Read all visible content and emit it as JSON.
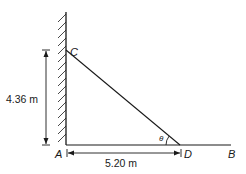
{
  "diagram": {
    "points": {
      "C": "C",
      "A": "A",
      "D": "D",
      "B": "B"
    },
    "angle_label": "θ",
    "dimensions": {
      "height": "4.36 m",
      "base": "5.20 m"
    },
    "colors": {
      "line": "#1a1a1a",
      "background": "#ffffff"
    }
  }
}
